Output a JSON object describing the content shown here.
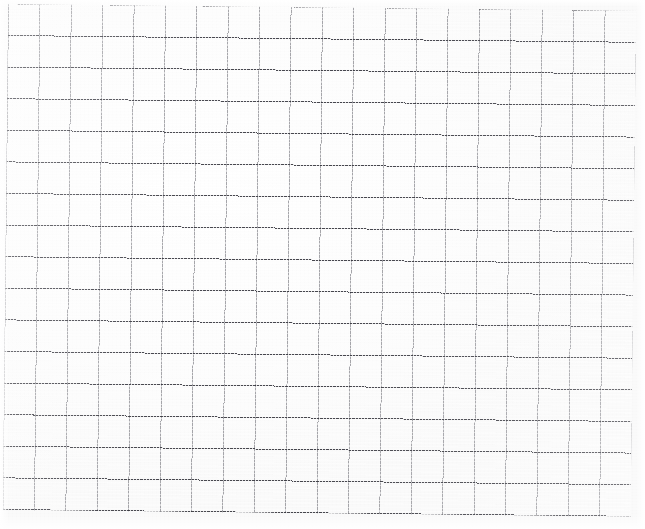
{
  "document": {
    "title": "Blank square grid paper (scanned sheet)",
    "kind": "graph-paper-scan",
    "caption": "Blank square-ruled graph paper, scanned; no handwriting, labels or markings present."
  },
  "page": {
    "width_px": 645,
    "height_px": 529,
    "background_color": "#ffffff",
    "paper_color": "#fdfdfd"
  },
  "chart_data": {
    "type": "table",
    "title": "",
    "subtitle": "",
    "xlabel": "",
    "ylabel": "",
    "grid": true,
    "legend_position": "none",
    "annotations": [],
    "categories": [],
    "values": [],
    "series": []
  },
  "grid": {
    "columns": 20,
    "rows": 16,
    "cell_width_px": 31.4,
    "cell_height_px": 31.6,
    "origin_x_px": 8,
    "origin_y_px": 4,
    "block_width_px": 628,
    "block_height_px": 506,
    "rotation_deg": 0.62,
    "vertical_line_color": "#606068",
    "horizontal_line_color": "#26262e",
    "horizontal_line_style": "dashed",
    "vertical_line_style": "solid-faint",
    "line_weight_px": 1
  },
  "margins": {
    "left_px": 8,
    "top_px": 4,
    "right_px": 9,
    "bottom_px": 15
  }
}
